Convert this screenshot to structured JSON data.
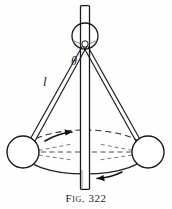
{
  "figure": {
    "caption_prefix": "Fig.",
    "caption_number": "322",
    "caption_full": "FIG. 322",
    "background_color": "#fefefe",
    "ink_color": "#1a1a1a"
  },
  "labels": {
    "arm_length": "l",
    "angle": "θ"
  },
  "diagram": {
    "type": "conical-pendulum-governor",
    "shaft": {
      "name": "vertical-rotating-shaft",
      "top_y": 5,
      "bottom_y": 190,
      "center_x": 85,
      "half_width": 5
    },
    "hub": {
      "name": "pivot-hub",
      "cx": 85,
      "cy": 36,
      "r": 13
    },
    "pivot_point": {
      "cx": 85,
      "cy": 44,
      "r": 3
    },
    "arms": [
      {
        "name": "left-arm",
        "from_x": 85,
        "from_y": 44,
        "to_x": 28,
        "to_y": 148
      },
      {
        "name": "right-arm",
        "from_x": 85,
        "from_y": 44,
        "to_x": 143,
        "to_y": 148
      }
    ],
    "bobs": [
      {
        "name": "left-bob",
        "cx": 23,
        "cy": 152,
        "r": 16
      },
      {
        "name": "right-bob",
        "cx": 148,
        "cy": 152,
        "r": 16
      }
    ],
    "orbit_ellipse": {
      "name": "rotation-path-ellipse",
      "cx": 85,
      "cy": 152,
      "rx": 62,
      "ry": 22,
      "style": "dashed"
    },
    "rotation_arrows": [
      {
        "name": "orbit-arrow-right",
        "direction": "right",
        "position": "upper-left"
      },
      {
        "name": "orbit-arrow-left",
        "direction": "left",
        "position": "lower-right"
      }
    ],
    "axis_line": {
      "name": "horizontal-axis-dashed",
      "from_x": 23,
      "to_x": 148,
      "y": 152,
      "style": "dashed"
    }
  }
}
